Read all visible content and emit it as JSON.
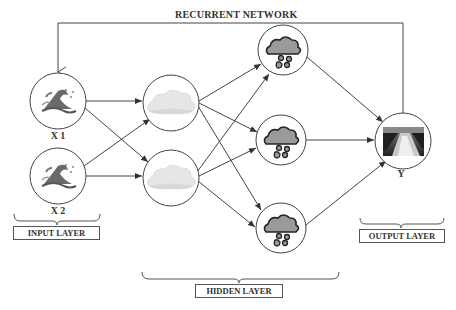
{
  "title": "RECURRENT NETWORK",
  "nodes": {
    "x1": {
      "label": "X 1",
      "icon": "wave-icon"
    },
    "x2": {
      "label": "X 2",
      "icon": "wave-icon"
    },
    "h1": {
      "icon": "cloud-icon"
    },
    "h2": {
      "icon": "cloud-icon"
    },
    "r1": {
      "icon": "rain-cloud-icon"
    },
    "r2": {
      "icon": "rain-cloud-icon"
    },
    "r3": {
      "icon": "rain-cloud-icon"
    },
    "y": {
      "label": "Y",
      "icon": "flooded-road-photo"
    }
  },
  "layers": {
    "input": "INPUT LAYER",
    "hidden": "HIDDEN LAYER",
    "output": "OUTPUT LAYER"
  },
  "colors": {
    "line": "#444444",
    "cloud_light": "#e3e3e3",
    "rain_cloud": "#9a9a9a",
    "wave_dark": "#555555"
  }
}
